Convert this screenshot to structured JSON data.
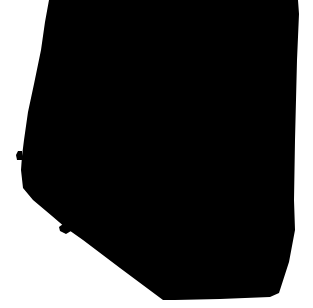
{
  "image": {
    "kind": "binary-silhouette-mask",
    "width": 313,
    "height": 308,
    "background_color": "#ffffff",
    "foreground_color": "#000000",
    "alt_text": "Large black silhouette shape on white background"
  },
  "shapes": {
    "main_silhouette": {
      "name": "main-silhouette",
      "fill": "#000000",
      "path": "M 49 0 L 298 0 L 299 14 L 297 60 L 295 140 L 294 200 L 295 230 L 289 262 L 279 293 L 270 297 L 220 299 L 175 300 L 163 300 L 120 268 L 83 240 L 66 228 L 52 216 L 33 200 L 23 188 L 21 170 L 22 156 L 24 140 L 28 112 L 34 84 L 41 50 L 45 22 Z"
    },
    "left_nub": {
      "name": "left-edge-nub",
      "fill": "#000000",
      "path": "M 22 151 L 22 160 L 17 160 L 16 155 L 18 151 Z"
    },
    "diagonal_blob": {
      "name": "lower-diagonal-blob",
      "fill": "#000000",
      "path": "M 63 224 L 70 226 L 71 231 L 66 234 L 60 231 L 59 227 Z"
    }
  },
  "regions": {
    "top_left_white_wedge": "white background wedge at upper left",
    "lower_left_white_triangle": "white background triangle at lower left",
    "right_white_strip": "white background strip along right edge",
    "bottom_white_margin": "white background margin along bottom edge"
  }
}
